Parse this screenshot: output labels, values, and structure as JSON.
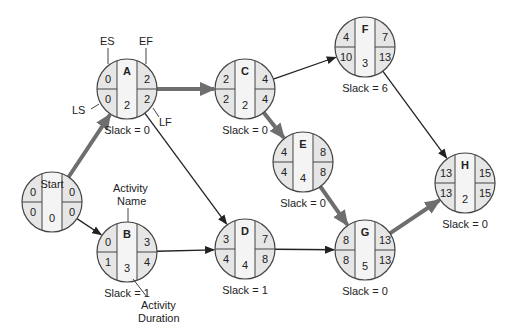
{
  "diagram": {
    "type": "activity-on-node network (critical path)",
    "nodes": [
      {
        "id": "Start",
        "name": "Start",
        "ES": "0",
        "EF": "0",
        "LS": "0",
        "LF": "0",
        "duration": "0",
        "slack": "",
        "cx": 52,
        "cy": 202
      },
      {
        "id": "A",
        "name": "A",
        "ES": "0",
        "EF": "2",
        "LS": "0",
        "LF": "2",
        "duration": "2",
        "slack": "Slack = 0",
        "cx": 127,
        "cy": 89
      },
      {
        "id": "B",
        "name": "B",
        "ES": "0",
        "EF": "3",
        "LS": "1",
        "LF": "4",
        "duration": "3",
        "slack": "Slack = 1",
        "cx": 127,
        "cy": 252
      },
      {
        "id": "C",
        "name": "C",
        "ES": "2",
        "EF": "4",
        "LS": "2",
        "LF": "4",
        "duration": "2",
        "slack": "Slack = 0",
        "cx": 245,
        "cy": 89
      },
      {
        "id": "D",
        "name": "D",
        "ES": "3",
        "EF": "7",
        "LS": "4",
        "LF": "8",
        "duration": "4",
        "slack": "Slack = 1",
        "cx": 245,
        "cy": 249
      },
      {
        "id": "E",
        "name": "E",
        "ES": "4",
        "EF": "8",
        "LS": "4",
        "LF": "8",
        "duration": "4",
        "slack": "Slack = 0",
        "cx": 303,
        "cy": 162
      },
      {
        "id": "F",
        "name": "F",
        "ES": "4",
        "EF": "7",
        "LS": "10",
        "LF": "13",
        "duration": "3",
        "slack": "Slack = 6",
        "cx": 365,
        "cy": 47
      },
      {
        "id": "G",
        "name": "G",
        "ES": "8",
        "EF": "13",
        "LS": "8",
        "LF": "13",
        "duration": "5",
        "slack": "Slack = 0",
        "cx": 365,
        "cy": 250
      },
      {
        "id": "H",
        "name": "H",
        "ES": "13",
        "EF": "15",
        "LS": "13",
        "LF": "15",
        "duration": "2",
        "slack": "Slack = 0",
        "cx": 465,
        "cy": 183
      }
    ],
    "edges": [
      {
        "from": "Start",
        "to": "A",
        "critical": true
      },
      {
        "from": "Start",
        "to": "B",
        "critical": false
      },
      {
        "from": "A",
        "to": "C",
        "critical": true
      },
      {
        "from": "A",
        "to": "D",
        "critical": false
      },
      {
        "from": "B",
        "to": "D",
        "critical": false
      },
      {
        "from": "C",
        "to": "F",
        "critical": false
      },
      {
        "from": "C",
        "to": "E",
        "critical": true
      },
      {
        "from": "E",
        "to": "G",
        "critical": true
      },
      {
        "from": "D",
        "to": "G",
        "critical": false
      },
      {
        "from": "F",
        "to": "H",
        "critical": false
      },
      {
        "from": "G",
        "to": "H",
        "critical": true
      }
    ],
    "legend_labels": {
      "es": "ES",
      "ef": "EF",
      "ls": "LS",
      "lf": "LF",
      "activity_name_1": "Activity",
      "activity_name_2": "Name",
      "activity_duration_1": "Activity",
      "activity_duration_2": "Duration"
    },
    "colors": {
      "node_fill": "#e6e6e6",
      "node_center_fill": "#f4f4f4",
      "node_stroke": "#444444",
      "critical_edge": "#6e6e6e",
      "normal_edge": "#222222"
    }
  }
}
